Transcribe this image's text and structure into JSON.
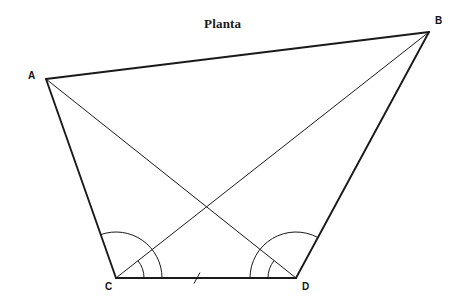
{
  "figure": {
    "title": "Planta",
    "title_position": {
      "x": 204,
      "y": 16
    },
    "background_color": "#ffffff",
    "stroke_color": "#1a1a1a",
    "canvas": {
      "width": 465,
      "height": 306
    }
  },
  "vertices": [
    {
      "id": "A",
      "label": "A",
      "x": 46,
      "y": 79,
      "label_x": 28,
      "label_y": 70
    },
    {
      "id": "B",
      "label": "B",
      "x": 429,
      "y": 32,
      "label_x": 435,
      "label_y": 15
    },
    {
      "id": "C",
      "label": "C",
      "x": 116,
      "y": 278,
      "label_x": 105,
      "label_y": 281
    },
    {
      "id": "D",
      "label": "D",
      "x": 296,
      "y": 278,
      "label_x": 302,
      "label_y": 281
    }
  ],
  "edges": [
    {
      "id": "AB",
      "from": "A",
      "to": "B",
      "kind": "side",
      "width": 1.9
    },
    {
      "id": "BD",
      "from": "B",
      "to": "D",
      "kind": "side",
      "width": 1.9
    },
    {
      "id": "DC",
      "from": "D",
      "to": "C",
      "kind": "side",
      "width": 1.9
    },
    {
      "id": "CA",
      "from": "C",
      "to": "A",
      "kind": "side",
      "width": 1.9
    },
    {
      "id": "AD",
      "from": "A",
      "to": "D",
      "kind": "diagonal",
      "width": 1.0
    },
    {
      "id": "BC",
      "from": "B",
      "to": "C",
      "kind": "diagonal",
      "width": 1.0
    }
  ],
  "tick_marks": [
    {
      "id": "cd-tick",
      "on_edge": "DC",
      "x": 197,
      "y": 278,
      "length": 11,
      "slant_dx": 3
    }
  ],
  "angle_arcs": [
    {
      "id": "arc-ACD-outer",
      "vertex": "C",
      "from": "A",
      "to": "D",
      "radius": 46,
      "note": "angle ACD"
    },
    {
      "id": "arc-BCD-inner",
      "vertex": "C",
      "from": "B",
      "to": "D",
      "radius": 28,
      "note": "angle BCD"
    },
    {
      "id": "arc-BDC-outer",
      "vertex": "D",
      "from": "C",
      "to": "B",
      "radius": 46,
      "note": "angle BDC"
    },
    {
      "id": "arc-ADC-inner",
      "vertex": "D",
      "from": "C",
      "to": "A",
      "radius": 28,
      "note": "angle ADC"
    }
  ],
  "intersections": [
    {
      "id": "diagonal-crossing",
      "x": 206,
      "y": 208,
      "edges": [
        "AD",
        "BC"
      ]
    }
  ]
}
